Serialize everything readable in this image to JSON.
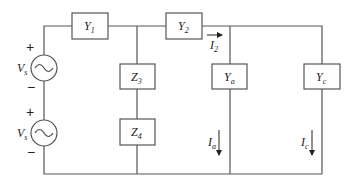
{
  "diagram": {
    "type": "circuit",
    "sources": [
      {
        "id": "source-top",
        "label": "V",
        "sub": "s",
        "plus": "+",
        "minus": "−",
        "kind": "ac-voltage"
      },
      {
        "id": "source-bottom",
        "label": "V",
        "sub": "s",
        "plus": "+",
        "minus": "−",
        "kind": "ac-voltage"
      }
    ],
    "elements": {
      "y1": {
        "label": "Y",
        "sub": "1"
      },
      "y2": {
        "label": "Y",
        "sub": "2"
      },
      "z3": {
        "label": "Z",
        "sub": "3"
      },
      "z4": {
        "label": "Z",
        "sub": "4"
      },
      "ya": {
        "label": "Y",
        "sub": "a"
      },
      "yc": {
        "label": "Y",
        "sub": "c"
      }
    },
    "currents": {
      "i2": {
        "label": "I",
        "sub": "2",
        "direction": "right"
      },
      "ia": {
        "label": "I",
        "sub": "a",
        "direction": "down"
      },
      "ic": {
        "label": "I",
        "sub": "c",
        "direction": "down"
      }
    }
  }
}
